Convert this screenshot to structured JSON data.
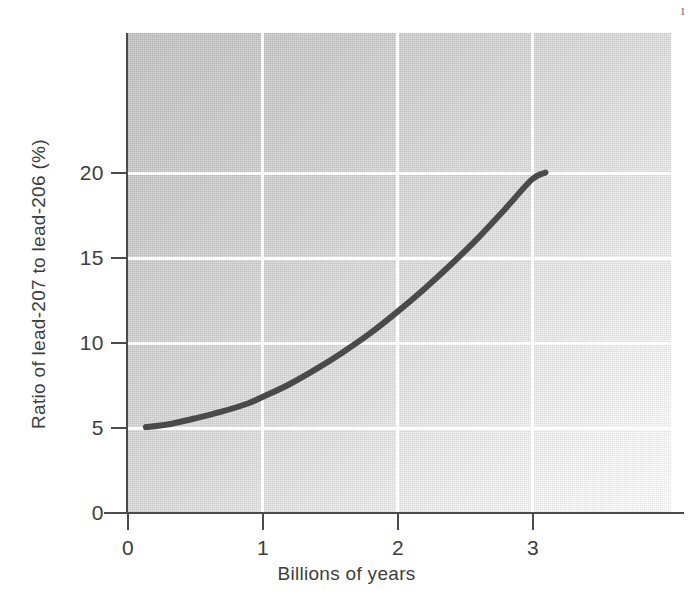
{
  "chart_data": {
    "type": "line",
    "title": "",
    "subtitle": "",
    "xlabel": "Billions of years",
    "ylabel": "Ratio of lead-207 to lead-206 (%)",
    "xlim": [
      0,
      4.03
    ],
    "ylim": [
      0,
      28.2
    ],
    "xticks": [
      0,
      1,
      2,
      3
    ],
    "xtick_labels": [
      "0",
      "1",
      "2",
      "3"
    ],
    "yticks": [
      0,
      5,
      10,
      15,
      20
    ],
    "ytick_labels": [
      "0",
      "5",
      "10",
      "15",
      "20"
    ],
    "grid": true,
    "grid_color": "#fdfdfd",
    "legend": null,
    "legend_position": "none",
    "series": [
      {
        "name": "Lead-207 / lead-206 ratio",
        "color": "#4a4a4a",
        "line_width": 6,
        "x": [
          0.14,
          0.3,
          0.5,
          0.7,
          0.9,
          1.0,
          1.2,
          1.4,
          1.6,
          1.8,
          2.0,
          2.2,
          2.4,
          2.6,
          2.8,
          3.0,
          3.1
        ],
        "y": [
          5.05,
          5.2,
          5.55,
          5.95,
          6.45,
          6.8,
          7.55,
          8.45,
          9.45,
          10.55,
          11.8,
          13.15,
          14.6,
          16.15,
          17.85,
          19.6,
          20.0
        ]
      }
    ],
    "annotations": []
  },
  "axes": {
    "x_title": "Billions of years",
    "y_title": "Ratio of lead-207 to lead-206 (%)",
    "x_tick_labels": [
      "0",
      "1",
      "2",
      "3"
    ],
    "y_tick_labels": [
      "0",
      "5",
      "10",
      "15",
      "20"
    ]
  },
  "artifact": {
    "corner_mark": "ı"
  }
}
